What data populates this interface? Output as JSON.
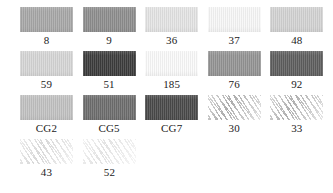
{
  "palette": {
    "background_color": "#ffffff",
    "label_color": "#1b1b1b",
    "columns": 5,
    "rows": [
      {
        "cells": [
          {
            "label": "8",
            "color": "#a8a8a8",
            "texture": "solid"
          },
          {
            "label": "9",
            "color": "#8e8e8e",
            "texture": "solid"
          },
          {
            "label": "36",
            "color": "#e4e4e4",
            "texture": "solid"
          },
          {
            "label": "37",
            "color": "#f7f7f7",
            "texture": "solid"
          },
          {
            "label": "48",
            "color": "#d3d3d3",
            "texture": "solid"
          }
        ]
      },
      {
        "cells": [
          {
            "label": "59",
            "color": "#d6d6d6",
            "texture": "solid"
          },
          {
            "label": "51",
            "color": "#3c3c3c",
            "texture": "solid"
          },
          {
            "label": "185",
            "color": "#fafafa",
            "texture": "solid"
          },
          {
            "label": "76",
            "color": "#949494",
            "texture": "solid"
          },
          {
            "label": "92",
            "color": "#5e5e5e",
            "texture": "solid"
          }
        ]
      },
      {
        "cells": [
          {
            "label": "CG2",
            "color": "#c2c2c2",
            "texture": "solid"
          },
          {
            "label": "CG5",
            "color": "#6e6e6e",
            "texture": "solid"
          },
          {
            "label": "CG7",
            "color": "#4a4a4a",
            "texture": "solid"
          },
          {
            "label": "30",
            "color": "#9a9a9a",
            "texture": "hatch"
          },
          {
            "label": "33",
            "color": "#9e9e9e",
            "texture": "hatch"
          }
        ]
      },
      {
        "cells": [
          {
            "label": "43",
            "color": "#cfcfcf",
            "texture": "hatch"
          },
          {
            "label": "52",
            "color": "#dcdcdc",
            "texture": "hatch"
          }
        ]
      }
    ]
  }
}
